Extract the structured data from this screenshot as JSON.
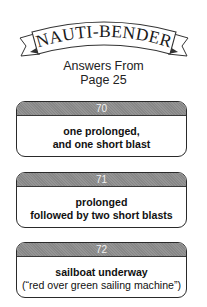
{
  "header": {
    "title": "NAUTI-BENDER",
    "subtitle_line1": "Answers From",
    "subtitle_line2": "Page 25"
  },
  "answers": [
    {
      "number": "70",
      "line1": "one prolonged,",
      "line2": "and one short blast",
      "line2_bold": true
    },
    {
      "number": "71",
      "line1": "prolonged",
      "line2": "followed by two short blasts",
      "line2_bold": true
    },
    {
      "number": "72",
      "line1": "sailboat underway",
      "line2": "(“red over green sailing machine”)",
      "line2_bold": false
    }
  ]
}
